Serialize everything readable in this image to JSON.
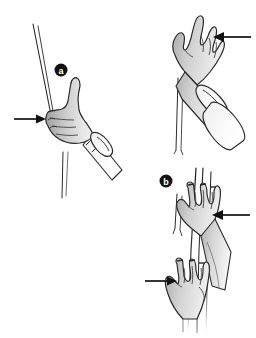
{
  "figure": {
    "background_color": "#ffffff",
    "line_color": "#1a1a1a",
    "skin_fill_light": "#f0f0f0",
    "skin_fill_mid": "#d4d4d4",
    "skin_fill_dark": "#9a9a9a",
    "label_circle_color": "#111111",
    "label_text_color": "#ffffff",
    "arrow_color": "#111111",
    "width": 256,
    "height": 338
  },
  "panels": [
    {
      "id": "panel-a",
      "label": "a",
      "label_x": 61,
      "label_y": 70,
      "label_radius": 6.5,
      "caption": "Hand grasping the rod with thumb extended"
    },
    {
      "id": "panel-b",
      "label": "b",
      "label_x": 166,
      "label_y": 181,
      "label_radius": 6.5,
      "caption": "Two hands positioned on the vertical pole"
    }
  ],
  "arrows": [
    {
      "id": "arrow-panel-a-left",
      "direction": "right",
      "x1": 14,
      "y1": 119,
      "x2": 46,
      "y2": 119,
      "points_to": "fingertips of grasping hand"
    },
    {
      "id": "arrow-top-right",
      "direction": "left",
      "x1": 251,
      "y1": 37,
      "x2": 213,
      "y2": 37,
      "points_to": "spread fingers of open hand"
    },
    {
      "id": "arrow-panel-b-upper",
      "direction": "left",
      "x1": 250,
      "y1": 215,
      "x2": 212,
      "y2": 215,
      "points_to": "back of upper hand on pole"
    },
    {
      "id": "arrow-panel-b-lower",
      "direction": "right",
      "x1": 145,
      "y1": 281,
      "x2": 177,
      "y2": 281,
      "points_to": "back of lower hand on pole"
    }
  ],
  "hands": [
    {
      "id": "hand-panel-a",
      "panel": "a",
      "pose": "side grip with extended thumb holding a thin rod",
      "has_cuff": true,
      "finger_count": 4
    },
    {
      "id": "hand-top-right",
      "panel": "a",
      "pose": "open hand with thumb spread away from fingers",
      "has_cuff": true,
      "finger_count": 4
    },
    {
      "id": "hand-panel-b-upper",
      "panel": "b",
      "pose": "upper hand wrapped around vertical pole",
      "has_cuff": false,
      "finger_count": 4
    },
    {
      "id": "hand-panel-b-lower",
      "panel": "b",
      "pose": "lower hand wrapped around vertical pole",
      "has_cuff": false,
      "finger_count": 4
    }
  ],
  "objects": [
    {
      "id": "rod-panel-a",
      "type": "thin rod",
      "orientation": "diagonal"
    },
    {
      "id": "pole-panel-b",
      "type": "vertical pole",
      "orientation": "vertical"
    },
    {
      "id": "forearm-top-right",
      "type": "forearm with sleeve",
      "orientation": "diagonal"
    }
  ]
}
